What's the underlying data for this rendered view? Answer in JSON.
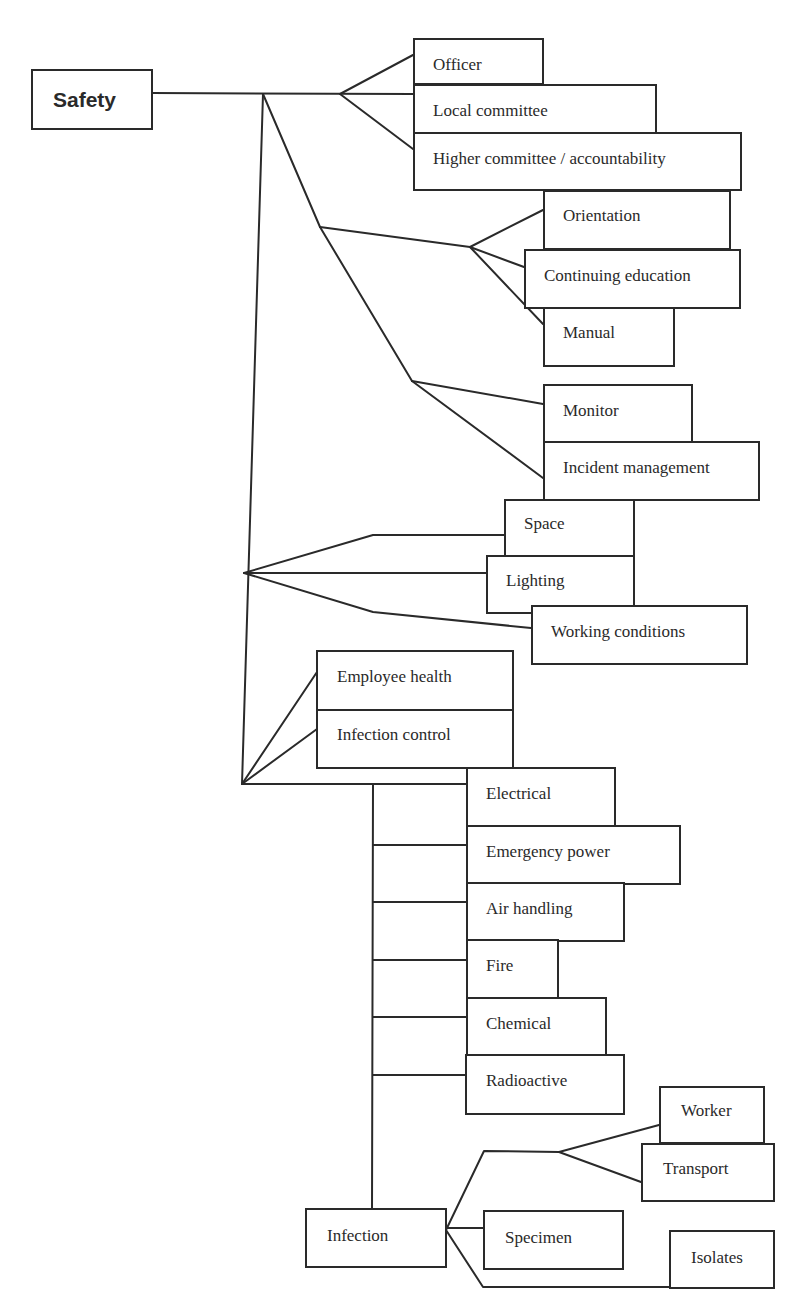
{
  "diagram": {
    "title": "Safety",
    "root": {
      "label": "Safety"
    },
    "groups": [
      {
        "name": "organization",
        "items": [
          "Officer",
          "Local committee",
          "Higher committee / accountability"
        ]
      },
      {
        "name": "education",
        "items": [
          "Orientation",
          "Continuing education",
          "Manual"
        ]
      },
      {
        "name": "oversight",
        "items": [
          "Monitor",
          "Incident management"
        ]
      },
      {
        "name": "environment",
        "items": [
          "Space",
          "Lighting",
          "Working conditions"
        ]
      },
      {
        "name": "health",
        "items": [
          "Employee health",
          "Infection control"
        ]
      },
      {
        "name": "hazards",
        "items": [
          "Electrical",
          "Emergency power",
          "Air handling",
          "Fire",
          "Chemical",
          "Radioactive",
          "Infection"
        ]
      },
      {
        "name": "infection",
        "parent": "Infection",
        "items": [
          "Worker",
          "Transport",
          "Specimen",
          "Isolates"
        ]
      }
    ]
  },
  "nodes": {
    "safety": "Safety",
    "officer": "Officer",
    "local_committee": "Local committee",
    "higher_committee": "Higher committee / accountability",
    "orientation": "Orientation",
    "continuing_education": "Continuing education",
    "manual": "Manual",
    "monitor": "Monitor",
    "incident_management": "Incident management",
    "space": "Space",
    "lighting": "Lighting",
    "working_conditions": "Working conditions",
    "employee_health": "Employee health",
    "infection_control": "Infection control",
    "electrical": "Electrical",
    "emergency_power": "Emergency power",
    "air_handling": "Air handling",
    "fire": "Fire",
    "chemical": "Chemical",
    "radioactive": "Radioactive",
    "infection": "Infection",
    "worker": "Worker",
    "transport": "Transport",
    "specimen": "Specimen",
    "isolates": "Isolates"
  },
  "colors": {
    "line": "#2a2a2a",
    "background": "#ffffff",
    "text": "#2a2a2a"
  }
}
